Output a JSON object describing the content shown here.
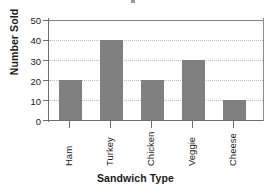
{
  "chart_data": {
    "type": "bar",
    "title": "",
    "categories": [
      "Ham",
      "Turkey",
      "Chicken",
      "Veggie",
      "Cheese"
    ],
    "values": [
      20,
      40,
      20,
      30,
      10
    ],
    "xlabel": "Sandwich Type",
    "ylabel": "Number Sold",
    "ylim": [
      0,
      50
    ],
    "yticks": [
      0,
      10,
      20,
      30,
      40,
      50
    ],
    "ytick_labels": [
      "0",
      "10",
      "20",
      "30",
      "40",
      "50"
    ],
    "grid": "horizontal-dotted",
    "legend": "none",
    "bar_color": "#808080",
    "axis_color": "#6e6e6e",
    "gridline_color": "#b9b9b9",
    "background_color": "#ffffff"
  }
}
